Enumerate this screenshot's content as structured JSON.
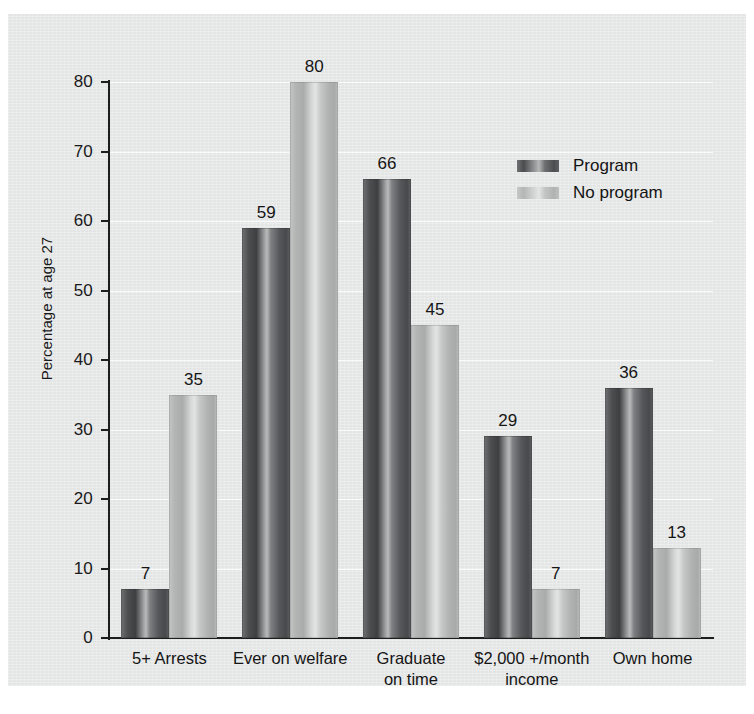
{
  "chart_data": {
    "type": "bar",
    "title": "",
    "subtitle": "",
    "xlabel": "",
    "ylabel": "Percentage at age 27",
    "ylim": [
      0,
      80
    ],
    "yticks": [
      0,
      10,
      20,
      30,
      40,
      50,
      60,
      70,
      80
    ],
    "ytick_labels": [
      "0",
      "10",
      "20",
      "30",
      "40",
      "50",
      "60",
      "70",
      "80"
    ],
    "grid": "horizontal-white-gridlines",
    "legend_position": "upper-right-inside",
    "categories": [
      "5+ Arrests",
      "Ever on welfare",
      "Graduate on time",
      "$2,000 +/month income",
      "Own home"
    ],
    "category_lines": [
      [
        "5+ Arrests"
      ],
      [
        "Ever on welfare"
      ],
      [
        "Graduate",
        "on time"
      ],
      [
        "$2,000 +/month",
        "income"
      ],
      [
        "Own home"
      ]
    ],
    "series": [
      {
        "name": "Program",
        "color": "#4c4e50",
        "values": [
          7,
          59,
          66,
          29,
          36
        ],
        "labels": [
          "7",
          "59",
          "66",
          "29",
          "36"
        ]
      },
      {
        "name": "No program",
        "color": "#bdbfbf",
        "values": [
          35,
          80,
          45,
          7,
          13
        ],
        "labels": [
          "35",
          "80",
          "45",
          "7",
          "13"
        ]
      }
    ]
  },
  "legend": {
    "entries": [
      {
        "label": "Program",
        "swatch": "dark"
      },
      {
        "label": "No program",
        "swatch": "light"
      }
    ]
  },
  "colors": {
    "background": "#e9eaea",
    "page": "#ffffff",
    "axis": "#1d1d1d",
    "gridline": "#ffffff",
    "text": "#151515"
  }
}
